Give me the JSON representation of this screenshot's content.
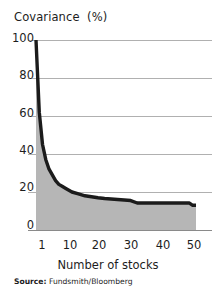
{
  "chart_data": {
    "type": "area",
    "title": "Covariance  (%)",
    "xlabel": "Number of stocks",
    "ylabel": "Covariance (%)",
    "xlim": [
      1,
      50
    ],
    "ylim": [
      0,
      100
    ],
    "grid": true,
    "legend": null,
    "yticks": [
      0,
      20,
      40,
      60,
      80,
      100
    ],
    "ytick_labels": [
      "0",
      "20",
      "40",
      "60",
      "80",
      "100"
    ],
    "xticks": [
      1,
      10,
      20,
      30,
      40,
      50
    ],
    "xtick_labels": [
      "1",
      "10",
      "20",
      "30",
      "40",
      "50"
    ],
    "x": [
      1,
      2,
      3,
      4,
      5,
      6,
      7,
      8,
      9,
      10,
      12,
      14,
      16,
      18,
      20,
      22,
      25,
      28,
      30,
      32,
      35,
      38,
      40,
      43,
      46,
      48,
      49,
      50
    ],
    "values": [
      100,
      62,
      45,
      37,
      32,
      29,
      26,
      24,
      23,
      22,
      20,
      19,
      18,
      17.5,
      17,
      16.6,
      16.2,
      15.8,
      15.5,
      14.2,
      14.2,
      14.2,
      14.2,
      14.2,
      14.2,
      14.2,
      13.0,
      13.0
    ],
    "series": [
      {
        "name": "Covariance",
        "values": [
          100,
          62,
          45,
          37,
          32,
          29,
          26,
          24,
          23,
          22,
          20,
          19,
          18,
          17.5,
          17,
          16.6,
          16.2,
          15.8,
          15.5,
          14.2,
          14.2,
          14.2,
          14.2,
          14.2,
          14.2,
          14.2,
          13.0,
          13.0
        ]
      }
    ],
    "line_color": "#1b1b1b",
    "fill_color": "#b6b6b6",
    "grid_color": "#b0b0b0",
    "axis_color": "#8a8a8a",
    "background": "#ffffff"
  },
  "source": {
    "label": "Source:",
    "value": "Fundsmith/Bloomberg"
  }
}
